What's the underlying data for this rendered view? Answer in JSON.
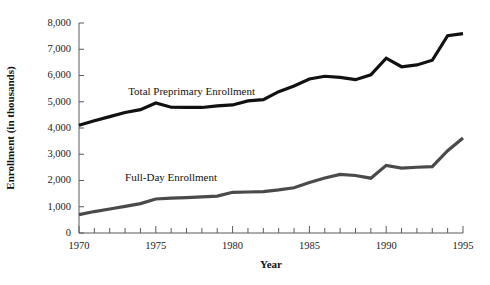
{
  "chart_data": {
    "type": "line",
    "title": "",
    "xlabel": "Year",
    "ylabel": "Enrollment (in thousands)",
    "xlim": [
      1970,
      1995
    ],
    "ylim": [
      0,
      8000
    ],
    "ytick_step": 1000,
    "xtick_step": 1,
    "xtick_label_step": 5,
    "grid": false,
    "legend_position": "inline-annotation",
    "x": [
      1970,
      1971,
      1972,
      1973,
      1974,
      1975,
      1976,
      1977,
      1978,
      1979,
      1980,
      1981,
      1982,
      1983,
      1984,
      1985,
      1986,
      1987,
      1988,
      1989,
      1990,
      1991,
      1992,
      1993,
      1994,
      1995
    ],
    "xtick_labels": [
      "1970",
      "1975",
      "1980",
      "1985",
      "1990",
      "1995"
    ],
    "ytick_labels": [
      "0",
      "1,000",
      "2,000",
      "3,000",
      "4,000",
      "5,000",
      "6,000",
      "7,000",
      "8,000"
    ],
    "series": [
      {
        "name": "Total Preprimary Enrollment",
        "color": "#111111",
        "width": 3.2,
        "label_x": 1973.2,
        "label_y": 5250,
        "values": [
          4104,
          4276,
          4434,
          4589,
          4699,
          4955,
          4790,
          4786,
          4782,
          4845,
          4878,
          5035,
          5081,
          5384,
          5598,
          5865,
          5971,
          5931,
          5841,
          6026,
          6659,
          6334,
          6403,
          6581,
          7514,
          7595
        ]
      },
      {
        "name": "Full-Day Enrollment",
        "color": "#4a4a4a",
        "width": 3.2,
        "label_x": 1973.0,
        "label_y": 2000,
        "values": [
          698,
          817,
          913,
          1012,
          1118,
          1295,
          1325,
          1350,
          1375,
          1406,
          1551,
          1562,
          1576,
          1640,
          1724,
          1924,
          2098,
          2233,
          2190,
          2088,
          2577,
          2474,
          2505,
          2530,
          3133,
          3620
        ]
      }
    ],
    "annotations": [
      {
        "text": "Total Preprimary Enrollment",
        "series": 0
      },
      {
        "text": "Full-Day Enrollment",
        "series": 1
      }
    ]
  },
  "figure": {
    "plot": {
      "left": 79,
      "right": 463,
      "top": 23,
      "bottom": 233
    },
    "axis_title_x_pos": {
      "x": 271,
      "y": 268
    },
    "axis_title_y_pos": {
      "x": 14,
      "y": 128
    }
  }
}
